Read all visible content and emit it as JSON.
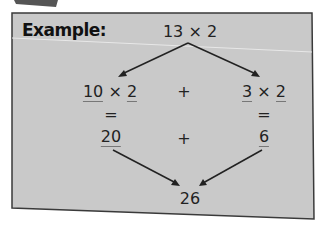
{
  "card": {
    "title": "Example:",
    "background": "#c9c9c9",
    "border": "#3a3a3a"
  },
  "diagram": {
    "top": "13 × 2",
    "left_split": {
      "tens": "10",
      "times": "×",
      "multiplier": "2"
    },
    "right_split": {
      "ones": "3",
      "times": "×",
      "multiplier": "2"
    },
    "plus_row1": "+",
    "equals_left": "=",
    "equals_right": "=",
    "left_product": "20",
    "right_product": "6",
    "plus_row2": "+",
    "result": "26"
  }
}
